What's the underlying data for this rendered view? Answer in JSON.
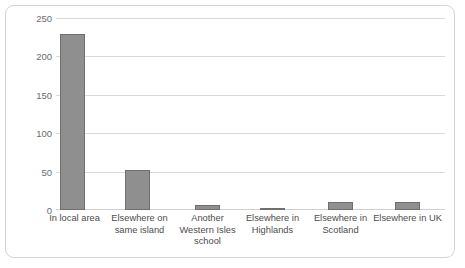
{
  "chart_data": {
    "type": "bar",
    "title": "",
    "xlabel": "",
    "ylabel": "Number of pupils",
    "categories": [
      "In local area",
      "Elsewhere on same island",
      "Another Western Isles school",
      "Elsewhere in Highlands",
      "Elsewhere in Scotland",
      "Elsewhere in UK"
    ],
    "values": [
      230,
      52,
      6,
      3,
      11,
      11
    ],
    "ylim": [
      0,
      250
    ],
    "yticks": [
      0,
      50,
      100,
      150,
      200,
      250
    ],
    "ytick_labels": [
      "0",
      "50",
      "100",
      "150",
      "200",
      "250"
    ],
    "grid": true,
    "legend": "none",
    "bar_color": "#8f8f8f",
    "bar_border_color": "#6f6f6f",
    "gridline_color": "#d9d9d9",
    "frame_color": "#d4d4d4",
    "text_color": "#4d4d4d"
  },
  "axis": {
    "y_title": "Number of pupils",
    "ticks": [
      {
        "label": "250",
        "value": 250
      },
      {
        "label": "200",
        "value": 200
      },
      {
        "label": "150",
        "value": 150
      },
      {
        "label": "100",
        "value": 100
      },
      {
        "label": "50",
        "value": 50
      },
      {
        "label": "0",
        "value": 0
      }
    ]
  },
  "categories": [
    {
      "label": "In local area",
      "value": 230
    },
    {
      "label": "Elsewhere on\nsame island",
      "value": 52
    },
    {
      "label": "Another\nWestern Isles\nschool",
      "value": 6
    },
    {
      "label": "Elsewhere in\nHighlands",
      "value": 3
    },
    {
      "label": "Elsewhere in\nScotland",
      "value": 11
    },
    {
      "label": "Elsewhere in UK",
      "value": 11
    }
  ]
}
